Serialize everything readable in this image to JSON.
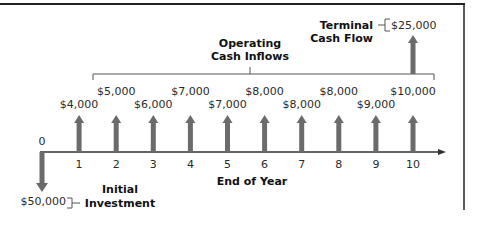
{
  "chart_data": {
    "type": "timeline",
    "title": "",
    "xlabel": "End of Year",
    "years": [
      0,
      1,
      2,
      3,
      4,
      5,
      6,
      7,
      8,
      9,
      10
    ],
    "initial_investment": {
      "year": 0,
      "value": -50000,
      "label": "$50,000",
      "caption_line1": "Initial",
      "caption_line2": "Investment"
    },
    "operating_inflows": {
      "caption_line1": "Operating",
      "caption_line2": "Cash Inflows",
      "values": [
        {
          "year": 1,
          "value": 4000,
          "label": "$4,000"
        },
        {
          "year": 2,
          "value": 5000,
          "label": "$5,000"
        },
        {
          "year": 3,
          "value": 6000,
          "label": "$6,000"
        },
        {
          "year": 4,
          "value": 7000,
          "label": "$7,000"
        },
        {
          "year": 5,
          "value": 7000,
          "label": "$7,000"
        },
        {
          "year": 6,
          "value": 8000,
          "label": "$8,000"
        },
        {
          "year": 7,
          "value": 8000,
          "label": "$8,000"
        },
        {
          "year": 8,
          "value": 8000,
          "label": "$8,000"
        },
        {
          "year": 9,
          "value": 9000,
          "label": "$9,000"
        },
        {
          "year": 10,
          "value": 10000,
          "label": "$10,000"
        }
      ]
    },
    "terminal_cash_flow": {
      "year": 10,
      "value": 25000,
      "label": "$25,000",
      "caption_line1": "Terminal",
      "caption_line2": "Cash Flow"
    }
  },
  "colors": {
    "arrow": "#6b6b6b",
    "line": "#3a3a3a",
    "frame": "#222222"
  }
}
